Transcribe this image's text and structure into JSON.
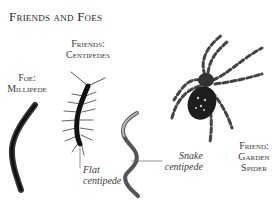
{
  "title": "Friends and Foes",
  "labels": {
    "centipedes": [
      "Friends:",
      "Centipedes"
    ],
    "millipede": [
      "Foe:",
      "Millipede"
    ],
    "spider": [
      "Friend:",
      "Garden",
      "Spider"
    ]
  },
  "captions": {
    "flat": [
      "Flat",
      "centipede"
    ],
    "snake": [
      "Snake",
      "centipede"
    ]
  }
}
